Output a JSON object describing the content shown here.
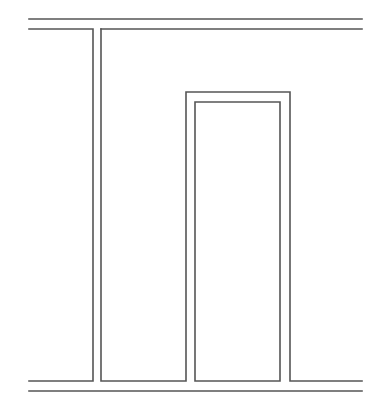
{
  "canvas": {
    "width": 391,
    "height": 413,
    "background": "#ffffff"
  },
  "style": {
    "stroke": "#555555"
  },
  "diagram": {
    "paths": [
      {
        "name": "top-outer-line",
        "d": "M29 19 L362 19"
      },
      {
        "name": "top-inner-line-left",
        "d": "M29 29 L93 29 L93 381 L29 381"
      },
      {
        "name": "inner-outline-main",
        "d": "M101 29 L362 29"
      },
      {
        "name": "stem-right-and-bottom-left-segment",
        "d": "M101 29 L101 381 L186 381 L186 92 L290 92 L290 381 L362 381"
      },
      {
        "name": "notch-inner-outline",
        "d": "M195 381 L195 102 L280 102 L280 381 L195 381"
      },
      {
        "name": "bottom-outer-line",
        "d": "M29 391 L362 391"
      }
    ]
  }
}
